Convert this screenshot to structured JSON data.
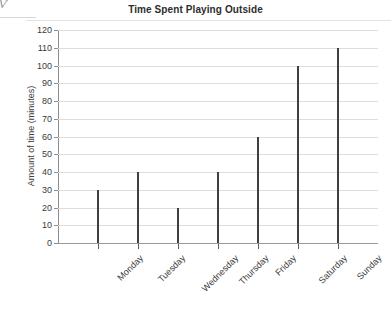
{
  "chart_data": {
    "type": "bar",
    "title": "Time Spent Playing Outside",
    "xlabel": "",
    "ylabel": "Amount of time (minutes)",
    "categories": [
      "Monday",
      "Tuesday",
      "Wednesday",
      "Thursday",
      "Friday",
      "Saturday",
      "Sunday"
    ],
    "values": [
      30,
      40,
      20,
      40,
      60,
      100,
      110
    ],
    "ylim": [
      0,
      120
    ],
    "ytick_step": 10,
    "yticks": [
      0,
      10,
      20,
      30,
      40,
      50,
      60,
      70,
      80,
      90,
      100,
      110,
      120
    ],
    "ytick_labels": [
      "0",
      "10",
      "20",
      "30",
      "40",
      "50",
      "60",
      "70",
      "80",
      "90",
      "100",
      "110",
      "120"
    ],
    "grid": true,
    "legend": null,
    "legend_position": "none",
    "series": [
      {
        "name": "Amount of time (minutes)",
        "values": [
          30,
          40,
          20,
          40,
          60,
          100,
          110
        ]
      }
    ],
    "colors": {
      "bar": "#3f3f3f",
      "grid": "#dedede",
      "axis": "#8c8c8c",
      "text": "#3b3b3b",
      "background": "#ffffff"
    }
  },
  "artifact": {
    "corner_mark": "V"
  }
}
